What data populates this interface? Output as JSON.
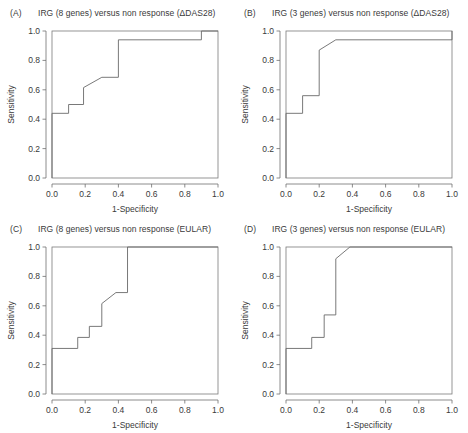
{
  "figure": {
    "width": 468,
    "height": 433,
    "background": "#ffffff",
    "line_color": "#6a6a6a",
    "text_color": "#3a3a3a"
  },
  "panels": [
    {
      "tag": "(A)",
      "title": "IRG (8 genes) versus non response (ΔDAS28)"
    },
    {
      "tag": "(B)",
      "title": "IRG (3 genes) versus non response (ΔDAS28)"
    },
    {
      "tag": "(C)",
      "title": "IRG (8 genes) versus non response (EULAR)"
    },
    {
      "tag": "(D)",
      "title": "IRG (3 genes) versus non response (EULAR)"
    }
  ],
  "axes": {
    "xlabel": "1-Specificity",
    "ylabel": "Sensitivity",
    "xticks": [
      "0.0",
      "0.2",
      "0.4",
      "0.6",
      "0.8",
      "1.0"
    ],
    "yticks": [
      "0.0",
      "0.2",
      "0.4",
      "0.6",
      "0.8",
      "1.0"
    ],
    "xtick_values": [
      0.0,
      0.2,
      0.4,
      0.6,
      0.8,
      1.0
    ],
    "ytick_values": [
      0.0,
      0.2,
      0.4,
      0.6,
      0.8,
      1.0
    ],
    "xlim": [
      0.0,
      1.0
    ],
    "ylim": [
      0.0,
      1.0
    ],
    "grid": false
  },
  "chart_data": [
    {
      "type": "line",
      "panel": "A",
      "title": "IRG (8 genes) versus non response (ΔDAS28)",
      "xlabel": "1-Specificity",
      "ylabel": "Sensitivity",
      "xlim": [
        0.0,
        1.0
      ],
      "ylim": [
        0.0,
        1.0
      ],
      "grid": false,
      "legend": null,
      "series": [
        {
          "name": "ROC curve",
          "x": [
            0.0,
            0.0,
            0.1,
            0.1,
            0.19,
            0.19,
            0.3,
            0.4,
            0.4,
            0.9,
            0.9,
            1.0
          ],
          "y": [
            0.0,
            0.44,
            0.44,
            0.5,
            0.5,
            0.615,
            0.685,
            0.685,
            0.94,
            0.94,
            1.0,
            1.0
          ]
        }
      ]
    },
    {
      "type": "line",
      "panel": "B",
      "title": "IRG (3 genes) versus non response (ΔDAS28)",
      "xlabel": "1-Specificity",
      "ylabel": "Sensitivity",
      "xlim": [
        0.0,
        1.0
      ],
      "ylim": [
        0.0,
        1.0
      ],
      "grid": false,
      "legend": null,
      "series": [
        {
          "name": "ROC curve",
          "x": [
            0.0,
            0.0,
            0.1,
            0.1,
            0.2,
            0.2,
            0.3,
            1.0,
            1.0
          ],
          "y": [
            0.0,
            0.44,
            0.44,
            0.56,
            0.56,
            0.87,
            0.94,
            0.94,
            1.0
          ]
        }
      ]
    },
    {
      "type": "line",
      "panel": "C",
      "title": "IRG (8 genes) versus non response (EULAR)",
      "xlabel": "1-Specificity",
      "ylabel": "Sensitivity",
      "xlim": [
        0.0,
        1.0
      ],
      "ylim": [
        0.0,
        1.0
      ],
      "grid": false,
      "legend": null,
      "series": [
        {
          "name": "ROC curve",
          "x": [
            0.0,
            0.0,
            0.155,
            0.155,
            0.225,
            0.225,
            0.3,
            0.3,
            0.385,
            0.455,
            0.455,
            1.0
          ],
          "y": [
            0.0,
            0.31,
            0.31,
            0.385,
            0.385,
            0.46,
            0.46,
            0.615,
            0.69,
            0.69,
            1.0,
            1.0
          ]
        }
      ]
    },
    {
      "type": "line",
      "panel": "D",
      "title": "IRG (3 genes) versus non response (EULAR)",
      "xlabel": "1-Specificity",
      "ylabel": "Sensitivity",
      "xlim": [
        0.0,
        1.0
      ],
      "ylim": [
        0.0,
        1.0
      ],
      "grid": false,
      "legend": null,
      "series": [
        {
          "name": "ROC curve",
          "x": [
            0.0,
            0.0,
            0.155,
            0.155,
            0.23,
            0.23,
            0.3,
            0.3,
            0.385,
            1.0
          ],
          "y": [
            0.0,
            0.31,
            0.31,
            0.385,
            0.385,
            0.538,
            0.538,
            0.92,
            1.0,
            1.0
          ]
        }
      ]
    }
  ]
}
